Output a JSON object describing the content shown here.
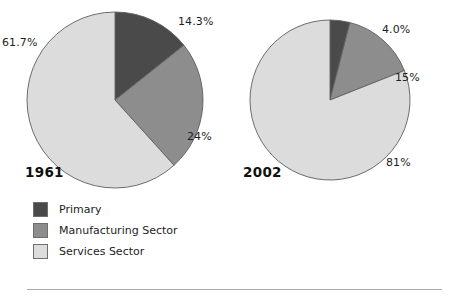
{
  "chart_data": [
    {
      "type": "pie",
      "title": "1961",
      "categories": [
        "Primary",
        "Manufacturing Sector",
        "Services Sector"
      ],
      "values": [
        14.3,
        24,
        61.7
      ],
      "labels": [
        "14.3%",
        "24%",
        "61.7%"
      ],
      "colors": [
        "#4a4a4a",
        "#8d8d8d",
        "#dcdcdc"
      ],
      "start_angle": 0,
      "direction": "clockwise",
      "legend": "bottom-left"
    },
    {
      "type": "pie",
      "title": "2002",
      "categories": [
        "Primary",
        "Manufacturing Sector",
        "Services Sector"
      ],
      "values": [
        4.0,
        15,
        81
      ],
      "labels": [
        "4.0%",
        "15%",
        "81%"
      ],
      "colors": [
        "#4a4a4a",
        "#8d8d8d",
        "#dcdcdc"
      ],
      "start_angle": 0,
      "direction": "clockwise",
      "legend": "bottom-left"
    }
  ],
  "charts": {
    "left": {
      "year": "1961",
      "primary_pct": "14.3%",
      "manufacturing_pct": "24%",
      "services_pct": "61.7%"
    },
    "right": {
      "year": "2002",
      "primary_pct": "4.0%",
      "manufacturing_pct": "15%",
      "services_pct": "81%"
    }
  },
  "legend": {
    "items": [
      {
        "label": "Primary",
        "color": "#4a4a4a"
      },
      {
        "label": "Manufacturing Sector",
        "color": "#8d8d8d"
      },
      {
        "label": "Services Sector",
        "color": "#dcdcdc"
      }
    ]
  },
  "palette": {
    "primary": "#4a4a4a",
    "manufacturing": "#8d8d8d",
    "services": "#dcdcdc",
    "outline": "#5d5d5d",
    "rule": "#a9a9a9",
    "background": "#ffffff"
  }
}
